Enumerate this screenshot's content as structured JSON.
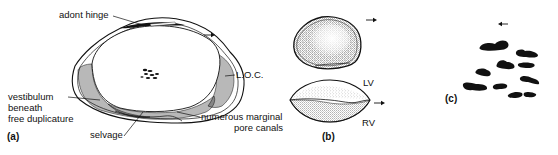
{
  "figure": {
    "panels": [
      {
        "id": "a",
        "label": "(a)",
        "annotations": {
          "adont_hinge": "adont hinge",
          "loc": "L.O.C.",
          "vestibulum_line1": "vestibulum",
          "vestibulum_line2": "beneath",
          "vestibulum_line3": "free duplicature",
          "selvage": "selvage",
          "marginal_line1": "numerous marginal",
          "marginal_line2": "pore canals"
        },
        "arrow_direction": "right"
      },
      {
        "id": "b",
        "label": "(b)",
        "annotations": {
          "lv": "LV",
          "rv": "RV"
        },
        "arrow_direction": "right"
      },
      {
        "id": "c",
        "label": "(c)",
        "arrow_direction": "left"
      }
    ],
    "colors": {
      "ink": "#111111",
      "background": "#ffffff"
    }
  }
}
